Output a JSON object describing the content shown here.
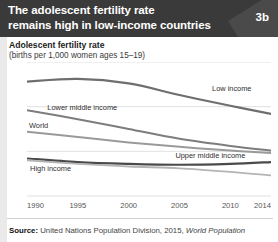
{
  "header": {
    "title": "The adolescent fertility rate\nremains high in low-income countries",
    "badge": "3b",
    "bg_color": "#3a3a3a"
  },
  "axis_title": "Adolescent fertility rate",
  "axis_subtitle": "(births per 1,000 women ages 15–19)",
  "source": {
    "label": "Source:",
    "text": " United Nations Population Division, 2015, ",
    "italic": "World Population"
  },
  "chart_data": {
    "type": "line",
    "title": "Adolescent fertility rate",
    "subtitle": "(births per 1,000 women ages 15–19)",
    "xlabel": "",
    "ylabel": "births per 1,000 women ages 15-19",
    "xlim": [
      1990,
      2014
    ],
    "ylim": [
      0,
      150
    ],
    "yticks": [
      0,
      50,
      100,
      150
    ],
    "xticks": [
      1990,
      1995,
      2000,
      2005,
      2010,
      2014
    ],
    "grid": "horizontal",
    "legend": "inline-labels",
    "x": [
      1990,
      1995,
      2000,
      2005,
      2010,
      2014
    ],
    "series": [
      {
        "name": "Low income",
        "color": "#6e6e6e",
        "width": 2.2,
        "label_x": 2008.2,
        "label_y": 118,
        "values": [
          128,
          131,
          126,
          113,
          101,
          92
        ]
      },
      {
        "name": "Lower middle income",
        "color": "#7d7d7d",
        "width": 2.0,
        "label_x": 1992.0,
        "label_y": 96,
        "values": [
          96,
          86,
          75,
          64,
          56,
          51
        ]
      },
      {
        "name": "World",
        "color": "#9a9a9a",
        "width": 2.0,
        "label_x": 1990.2,
        "label_y": 76,
        "values": [
          72,
          66,
          60,
          55,
          51,
          48
        ]
      },
      {
        "name": "Upper middle income",
        "color": "#4a4a4a",
        "width": 2.2,
        "label_x": 2004.6,
        "label_y": 43,
        "values": [
          42,
          38,
          36,
          35,
          36,
          38
        ]
      },
      {
        "name": "High income",
        "color": "#b4b4b4",
        "width": 1.8,
        "label_x": 1990.3,
        "label_y": 28,
        "values": [
          40,
          36,
          33,
          31,
          27,
          23
        ]
      }
    ]
  }
}
